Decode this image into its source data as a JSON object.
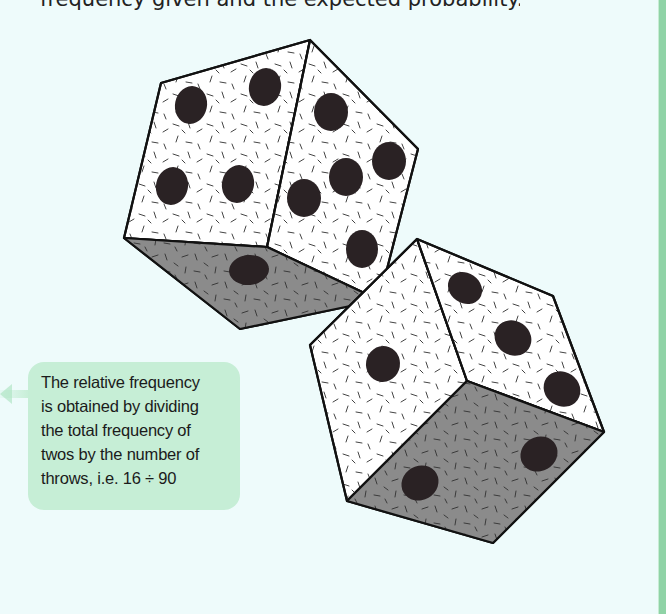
{
  "header": {
    "clipped_text": "frequency given and the expected probability."
  },
  "callout": {
    "lines": [
      "The relative frequency",
      "is obtained by dividing",
      "the total frequency of",
      "twos by the number of",
      "throws, i.e. 16 ÷ 90"
    ]
  },
  "illustration": {
    "name": "two-dice",
    "die_top": {
      "faces_visible": [
        4,
        5,
        1
      ]
    },
    "die_bottom": {
      "faces_visible": [
        1,
        3,
        2
      ]
    }
  },
  "colors": {
    "background": "#eefbfb",
    "callout_bg": "#c6eed6",
    "accent_rule": "#8fd3a6",
    "die_light_face": "#ffffff",
    "die_dark_face": "#8a8a8a",
    "pip": "#2a2224"
  }
}
